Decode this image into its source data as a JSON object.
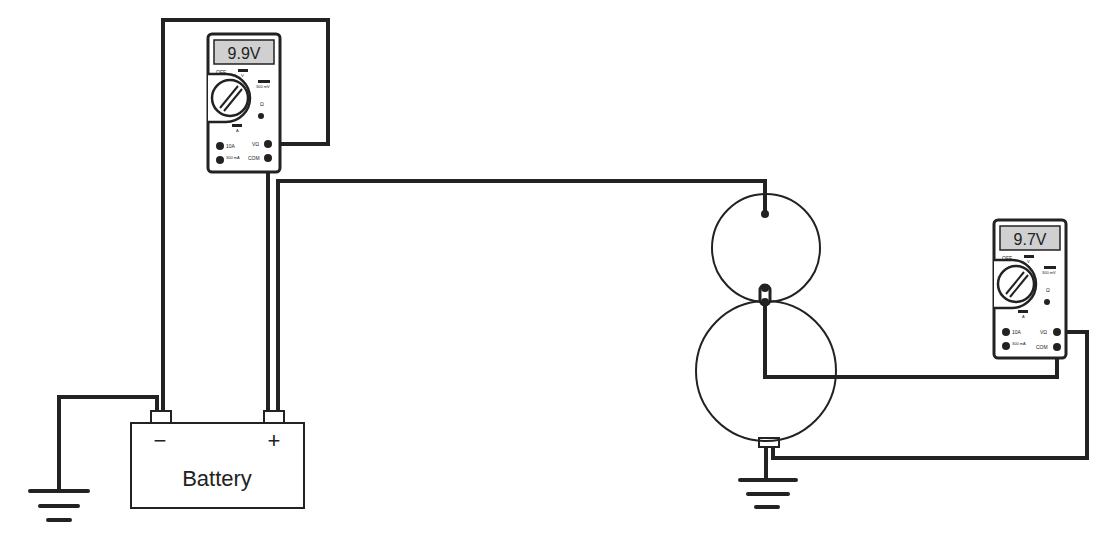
{
  "diagram": {
    "battery": {
      "label": "Battery",
      "negative_symbol": "−",
      "positive_symbol": "+"
    },
    "meter_left": {
      "display": "9.9V",
      "labels": {
        "off": "OFF",
        "mv": "300 mV",
        "ohm": "Ω",
        "a": "A",
        "v": "V",
        "jack_10a": "10A",
        "jack_300ma": "300 mA",
        "jack_vohm": "VΩ",
        "jack_com": "COM"
      }
    },
    "meter_right": {
      "display": "9.7V",
      "labels": {
        "off": "OFF",
        "mv": "300 mV",
        "ohm": "Ω",
        "a": "A",
        "v": "V",
        "jack_10a": "10A",
        "jack_300ma": "300 mA",
        "jack_vohm": "VΩ",
        "jack_com": "COM"
      }
    },
    "components": [
      "battery",
      "ground-battery",
      "solenoid-circle",
      "motor-circle",
      "ground-motor"
    ],
    "colors": {
      "line": "#222222",
      "display_bg": "#d0d0d0",
      "background": "#ffffff"
    }
  }
}
